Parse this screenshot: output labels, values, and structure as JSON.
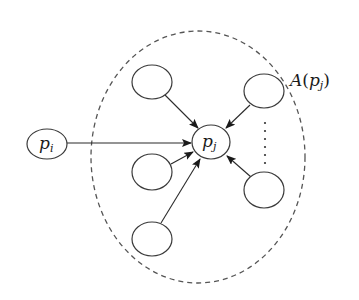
{
  "diagram": {
    "type": "directed-graph",
    "region": {
      "label_main": "A",
      "label_open": "(",
      "label_var": "p",
      "label_sub": "j",
      "label_close": ")",
      "style": "dashed-ellipse"
    },
    "nodes": [
      {
        "id": "p_i",
        "label_main": "p",
        "label_sub": "i",
        "position": "left, outside region"
      },
      {
        "id": "p_j",
        "label_main": "p",
        "label_sub": "j",
        "position": "center"
      },
      {
        "id": "n1",
        "label_main": "",
        "position": "top-left"
      },
      {
        "id": "n2",
        "label_main": "",
        "position": "top-right"
      },
      {
        "id": "n3",
        "label_main": "",
        "position": "middle-left"
      },
      {
        "id": "n4",
        "label_main": "",
        "position": "bottom-left"
      },
      {
        "id": "n5",
        "label_main": "",
        "position": "bottom-right"
      }
    ],
    "edges": [
      {
        "from": "p_i",
        "to": "p_j"
      },
      {
        "from": "n1",
        "to": "p_j"
      },
      {
        "from": "n2",
        "to": "p_j"
      },
      {
        "from": "n3",
        "to": "p_j"
      },
      {
        "from": "n4",
        "to": "p_j"
      },
      {
        "from": "n5",
        "to": "p_j"
      }
    ],
    "ellipsis": "vertical dots between top-right and bottom-right nodes",
    "colors": {
      "stroke": "#3a3a3a",
      "dashed": "#555555",
      "background": "#ffffff"
    }
  }
}
